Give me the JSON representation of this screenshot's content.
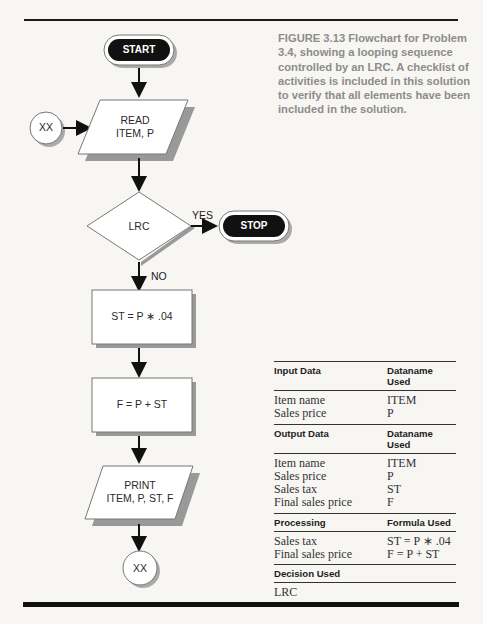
{
  "figure": {
    "caption": "FIGURE 3.13  Flowchart for Problem 3.4, showing a looping sequence controlled by an LRC. A checklist of activities is included in this solution to verify that all elements have been included in the solution."
  },
  "flowchart": {
    "start": "START",
    "connector_in": "XX",
    "read": {
      "line1": "READ",
      "line2": "ITEM, P"
    },
    "decision": "LRC",
    "yes_label": "YES",
    "no_label": "NO",
    "stop": "STOP",
    "process1": "ST = P ∗ .04",
    "process2": "F = P + ST",
    "print": {
      "line1": "PRINT",
      "line2": "ITEM, P, ST, F"
    },
    "connector_out": "XX"
  },
  "checklist": {
    "input": {
      "header": [
        "Input Data",
        "Dataname Used"
      ],
      "rows": [
        [
          "Item name",
          "ITEM"
        ],
        [
          "Sales price",
          "P"
        ]
      ]
    },
    "output": {
      "header": [
        "Output Data",
        "Dataname Used"
      ],
      "rows": [
        [
          "Item name",
          "ITEM"
        ],
        [
          "Sales price",
          "P"
        ],
        [
          "Sales tax",
          "ST"
        ],
        [
          "Final sales price",
          "F"
        ]
      ]
    },
    "processing": {
      "header": [
        "Processing",
        "Formula Used"
      ],
      "rows": [
        [
          "Sales tax",
          "ST = P ∗ .04"
        ],
        [
          "Final sales price",
          "F = P + ST"
        ]
      ]
    },
    "decision": {
      "header": [
        "Decision Used",
        ""
      ],
      "rows": [
        [
          "LRC",
          ""
        ]
      ]
    }
  }
}
